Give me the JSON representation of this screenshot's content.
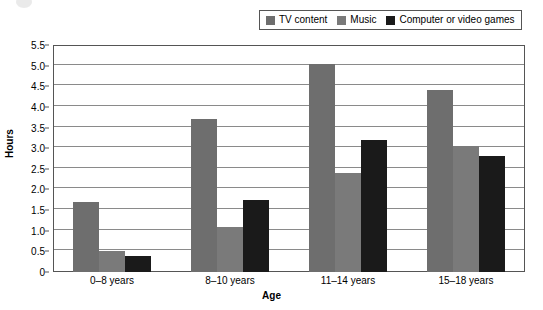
{
  "chart_data": {
    "type": "bar",
    "title": "",
    "xlabel": "Age",
    "ylabel": "Hours",
    "categories": [
      "0–8 years",
      "8–10 years",
      "11–14 years",
      "15–18 years"
    ],
    "series": [
      {
        "name": "TV content",
        "color": "#6e6e6e",
        "values": [
          1.7,
          3.7,
          5.05,
          4.4
        ]
      },
      {
        "name": "Music",
        "color": "#7a7a7a",
        "values": [
          0.5,
          1.1,
          2.4,
          3.05
        ]
      },
      {
        "name": "Computer or video games",
        "color": "#1a1a1a",
        "values": [
          0.4,
          1.75,
          3.2,
          2.8
        ]
      }
    ],
    "ylim": [
      0,
      5.5
    ],
    "y_ticks": [
      "0",
      "0.5",
      "1.0",
      "1.5",
      "2.0",
      "2.5",
      "3.0",
      "3.5",
      "4.0",
      "4.5",
      "5.0",
      "5.5"
    ],
    "y_tick_values": [
      0,
      0.5,
      1.0,
      1.5,
      2.0,
      2.5,
      3.0,
      3.5,
      4.0,
      4.5,
      5.0,
      5.5
    ],
    "grid": true,
    "legend_position": "top-right",
    "legend": [
      "TV content",
      "Music",
      "Computer or video games"
    ]
  },
  "legend": {
    "items": [
      {
        "label": "TV content",
        "swatch": "#6e6e6e"
      },
      {
        "label": "Music",
        "swatch": "#7a7a7a"
      },
      {
        "label": "Computer or video games",
        "swatch": "#1a1a1a"
      }
    ]
  }
}
